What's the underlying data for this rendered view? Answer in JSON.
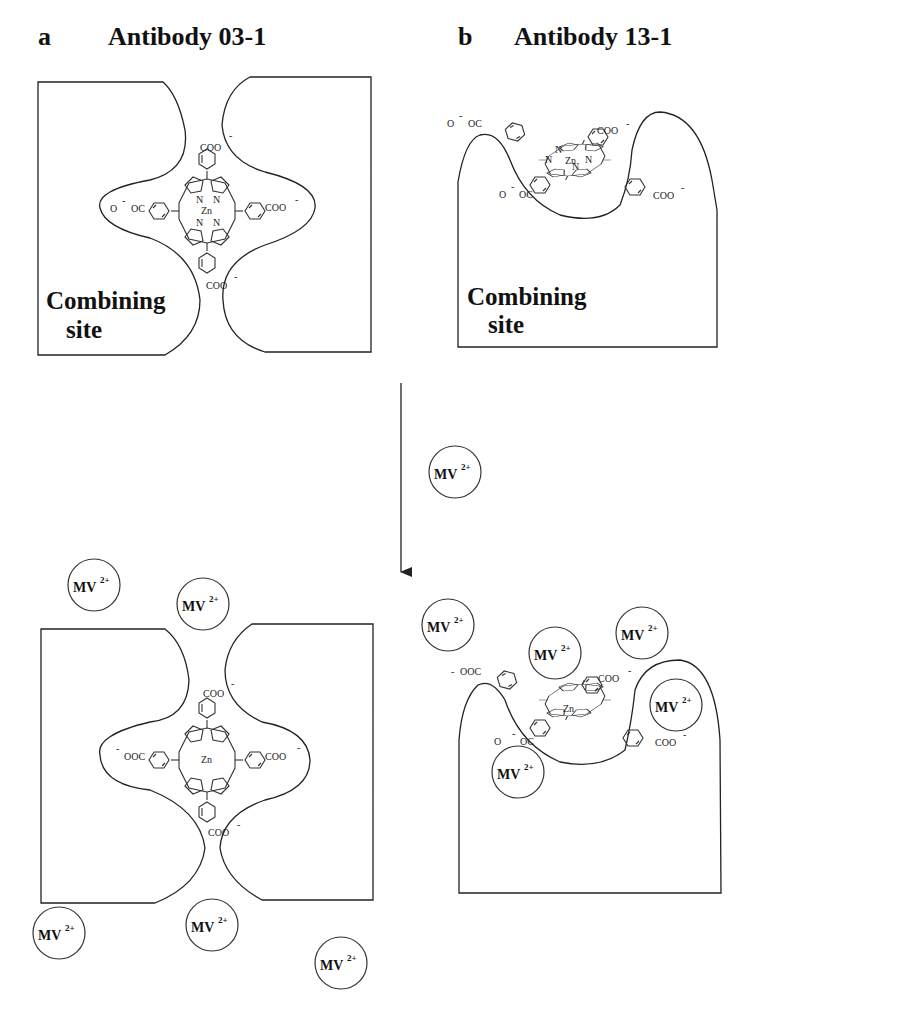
{
  "panels": [
    {
      "label": "a",
      "title": "Antibody 03-1",
      "site_label_line1": "Combining",
      "site_label_line2": "site",
      "porphyrin": {
        "metal": "Zn",
        "nitrogen": "N",
        "top_group": "COO",
        "right_group": "COO",
        "bottom_group": "COO",
        "left_group_before": "O",
        "left_group_after": "OC",
        "left_group_bottom_state": "OOC",
        "charge": "-"
      }
    },
    {
      "label": "b",
      "title": "Antibody 13-1",
      "site_label_line1": "Combining",
      "site_label_line2": "site",
      "porphyrin": {
        "metal": "Zn",
        "nitrogen": "N",
        "upper_left_group": "O",
        "upper_left_group_after": "OC",
        "upper_left_group_bottom_state": "OOC",
        "top_right_group": "COO",
        "lower_left_group": "O",
        "lower_left_group_after": "OC",
        "right_group": "COO",
        "charge": "-"
      }
    }
  ],
  "transition": {
    "arrow_direction": "down",
    "reagent": "MV",
    "reagent_charge": "2+"
  },
  "mv_ion": {
    "label": "MV",
    "charge": "2+",
    "count_panel_a_after": 5,
    "count_panel_b_after": 5
  }
}
